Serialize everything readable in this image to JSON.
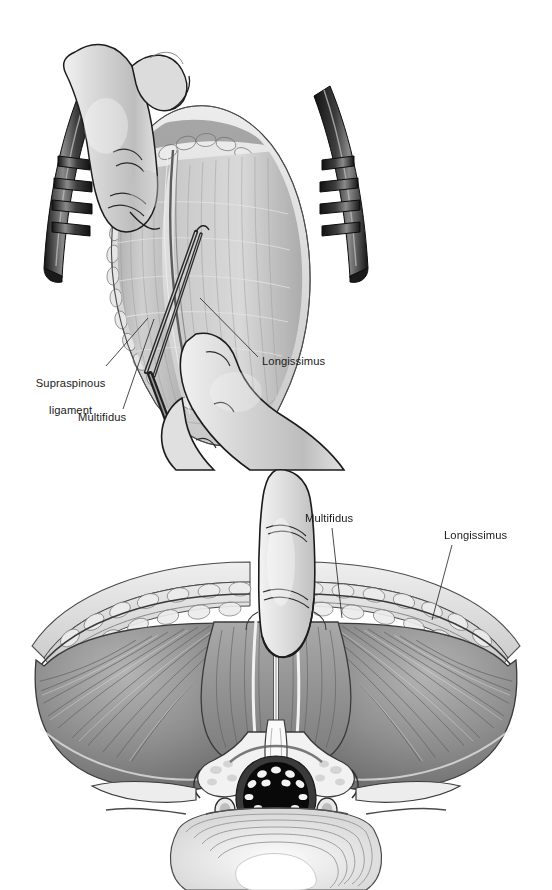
{
  "figure": {
    "style": "grayscale medical line-and-tone illustration",
    "background_color": "#ffffff",
    "ink_color": "#1b1b1b",
    "panel_count": 2
  },
  "panels": [
    {
      "id": "top",
      "view": "surgical field, operative view from above",
      "description": "Blunt finger dissection of the intermuscular plane between multifidus and longissimus, with self-retaining toothed retractors holding the wound open and scissors entering from below",
      "labels": [
        {
          "id": "supraspinous-ligament",
          "line1": "Supraspinous",
          "line2": "ligament",
          "x": 18,
          "y": 364,
          "align": "center",
          "leader": {
            "x1": 106,
            "y1": 366,
            "x2": 148,
            "y2": 318
          }
        },
        {
          "id": "multifidus",
          "line1": "Multifidus",
          "line2": "",
          "x": 78,
          "y": 411,
          "align": "left",
          "leader": {
            "x1": 123,
            "y1": 409,
            "x2": 154,
            "y2": 319
          }
        },
        {
          "id": "longissimus",
          "line1": "Longissimus",
          "line2": "",
          "x": 262,
          "y": 355,
          "align": "left",
          "leader": {
            "x1": 258,
            "y1": 357,
            "x2": 200,
            "y2": 298
          }
        }
      ],
      "elements": [
        "index-finger-from-above",
        "left-retractor",
        "right-retractor",
        "subcutaneous-fat-edge",
        "lumbodorsal-fascia",
        "multifidus-muscle",
        "longissimus-muscle",
        "intermuscular-cleft",
        "dissecting-scissors",
        "surgeon-hand-lower"
      ]
    },
    {
      "id": "bottom",
      "view": "axial cross-section of the lumbar spine",
      "description": "Transverse section showing the finger passing through the natural cleavage plane between multifidus and longissimus down to the facet joint and transverse process",
      "labels": [
        {
          "id": "multifidus",
          "line1": "Multifidus",
          "line2": "",
          "x": 305,
          "y": 512,
          "align": "left",
          "leader": {
            "x1": 332,
            "y1": 528,
            "x2": 342,
            "y2": 618
          }
        },
        {
          "id": "longissimus",
          "line1": "Longissimus",
          "line2": "",
          "x": 444,
          "y": 529,
          "align": "left",
          "leader": {
            "x1": 452,
            "y1": 545,
            "x2": 432,
            "y2": 620
          }
        }
      ],
      "elements": [
        "skin-and-subcutaneous-fat",
        "thoracolumbar-fascia",
        "multifidus-muscle",
        "longissimus-muscle",
        "intermuscular-plane",
        "index-finger-in-plane",
        "spinous-process",
        "lamina",
        "facet-joint",
        "transverse-process",
        "spinal-canal",
        "thecal-sac",
        "cauda-equina-nerve-roots",
        "exiting-nerve-roots",
        "vertebral-body",
        "intervertebral-disc-annulus"
      ]
    }
  ],
  "palette": {
    "ink": "#1b1b1b",
    "muscle_dark": "#7d7d7d",
    "muscle_mid": "#9a9a9a",
    "muscle_light": "#bcbcbc",
    "fat_light": "#dcdcdc",
    "skin_light": "#e6e6e6",
    "bone_white": "#f5f5f5",
    "metal_dark": "#262626",
    "metal_mid": "#6e6e6e",
    "canal_black": "#090909"
  }
}
